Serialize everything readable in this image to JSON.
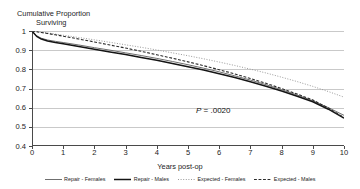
{
  "chart_data": {
    "type": "line",
    "title": "Cumulative Proportion Surviving",
    "title_line1": "Cumulative Proportion",
    "title_line2": "Surviving",
    "xlabel": "Years post-op",
    "ylabel": "Cumulative Proportion Surviving",
    "xlim": [
      0,
      10
    ],
    "ylim": [
      0.4,
      1.0
    ],
    "xticks": [
      "0",
      "1",
      "2",
      "3",
      "4",
      "5",
      "6",
      "7",
      "8",
      "9",
      "10"
    ],
    "yticks": [
      "0.4",
      "0.5",
      "0.6",
      "0.7",
      "0.8",
      "0.9",
      "1"
    ],
    "grid": "horizontal",
    "legend_position": "bottom",
    "annotations": [
      {
        "name": "p-value",
        "text_italic": "P",
        "text": " = .0020",
        "x": 5.9,
        "y": 0.655
      }
    ],
    "x": [
      0,
      0.15,
      0.3,
      0.5,
      0.75,
      1,
      1.5,
      2,
      2.5,
      3,
      3.5,
      4,
      4.5,
      5,
      5.5,
      6,
      6.5,
      7,
      7.5,
      8,
      8.5,
      9,
      9.5,
      10
    ],
    "series": [
      {
        "name": "Repair - Females",
        "style": "solid",
        "color": "#6f6f6f",
        "width": 1.0,
        "values": [
          1.0,
          0.975,
          0.962,
          0.953,
          0.946,
          0.94,
          0.927,
          0.913,
          0.9,
          0.886,
          0.872,
          0.857,
          0.841,
          0.824,
          0.806,
          0.787,
          0.766,
          0.744,
          0.72,
          0.694,
          0.666,
          0.636,
          0.6,
          0.56
        ]
      },
      {
        "name": "Repair - Males",
        "style": "solid",
        "color": "#141414",
        "width": 1.5,
        "values": [
          1.0,
          0.972,
          0.958,
          0.948,
          0.94,
          0.933,
          0.919,
          0.905,
          0.891,
          0.877,
          0.862,
          0.847,
          0.831,
          0.814,
          0.796,
          0.777,
          0.757,
          0.735,
          0.712,
          0.687,
          0.66,
          0.631,
          0.592,
          0.545
        ]
      },
      {
        "name": "Expected - Females",
        "style": "dotted",
        "color": "#9a9a9a",
        "width": 1.0,
        "values": [
          1.0,
          0.997,
          0.994,
          0.99,
          0.984,
          0.978,
          0.966,
          0.954,
          0.941,
          0.928,
          0.915,
          0.901,
          0.886,
          0.871,
          0.855,
          0.838,
          0.82,
          0.801,
          0.781,
          0.759,
          0.736,
          0.711,
          0.684,
          0.655
        ]
      },
      {
        "name": "Expected - Males",
        "style": "dashed",
        "color": "#2b2b2b",
        "width": 1.1,
        "values": [
          1.0,
          0.996,
          0.992,
          0.987,
          0.98,
          0.973,
          0.958,
          0.943,
          0.927,
          0.911,
          0.894,
          0.876,
          0.858,
          0.839,
          0.819,
          0.798,
          0.776,
          0.752,
          0.727,
          0.7,
          0.671,
          0.64,
          0.598,
          0.548
        ]
      }
    ]
  }
}
